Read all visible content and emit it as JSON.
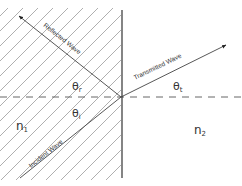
{
  "diagram": {
    "colors": {
      "background": "#ffffff",
      "hatch": "#9a9a9a",
      "lines": "#444444"
    },
    "media": {
      "left": {
        "symbol": "n",
        "subscript": "1",
        "pattern": "diagonal-hatch"
      },
      "right": {
        "symbol": "n",
        "subscript": "2"
      }
    },
    "rays": {
      "incident": {
        "label": "Incident Wave"
      },
      "reflected": {
        "label": "Reflected Wave"
      },
      "transmitted": {
        "label": "Transmitted Wave"
      }
    },
    "angles": {
      "incident": {
        "symbol": "θ",
        "subscript": "i"
      },
      "reflected": {
        "symbol": "θ",
        "subscript": "r"
      },
      "transmitted": {
        "symbol": "θ",
        "subscript": "t"
      }
    }
  }
}
